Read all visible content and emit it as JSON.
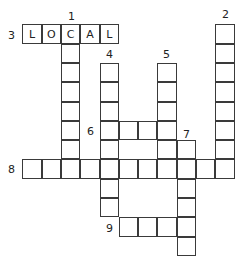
{
  "puzzle": {
    "cell_size": 19.3,
    "origin": {
      "x": 23,
      "y": 25
    },
    "entries": [
      {
        "number": "3",
        "direction": "across",
        "row": 0,
        "col": 0,
        "length": 5,
        "answer": "LOCAL",
        "label_pos": {
          "x": 8,
          "y": 30
        }
      },
      {
        "number": "1",
        "direction": "down",
        "row": 0,
        "col": 2,
        "length": 8,
        "answer": "",
        "label_pos": {
          "x": 68,
          "y": 11
        }
      },
      {
        "number": "2",
        "direction": "down",
        "row": 0,
        "col": 10,
        "length": 8,
        "answer": "",
        "label_pos": {
          "x": 222,
          "y": 9
        }
      },
      {
        "number": "4",
        "direction": "down",
        "row": 2,
        "col": 4,
        "length": 8,
        "answer": "",
        "label_pos": {
          "x": 106,
          "y": 49
        }
      },
      {
        "number": "5",
        "direction": "down",
        "row": 2,
        "col": 7,
        "length": 6,
        "answer": "",
        "label_pos": {
          "x": 163,
          "y": 49
        }
      },
      {
        "number": "6",
        "direction": "across",
        "row": 5,
        "col": 4,
        "length": 4,
        "answer": "",
        "label_pos": {
          "x": 87,
          "y": 126
        }
      },
      {
        "number": "7",
        "direction": "down",
        "row": 6,
        "col": 8,
        "length": 6,
        "answer": "",
        "label_pos": {
          "x": 183,
          "y": 129
        }
      },
      {
        "number": "8",
        "direction": "across",
        "row": 7,
        "col": 0,
        "length": 11,
        "answer": "",
        "label_pos": {
          "x": 8,
          "y": 164
        }
      },
      {
        "number": "9",
        "direction": "across",
        "row": 10,
        "col": 5,
        "length": 4,
        "answer": "",
        "label_pos": {
          "x": 106,
          "y": 223
        }
      }
    ]
  }
}
